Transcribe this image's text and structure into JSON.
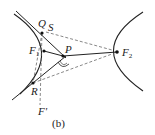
{
  "figure": {
    "caption": "(b)",
    "points": {
      "Q": "Q",
      "S": "S",
      "F1": "F",
      "F1_sub": "1",
      "P": "P",
      "R": "R",
      "Fprime": "F'",
      "F2": "F",
      "F2_sub": "2"
    }
  }
}
